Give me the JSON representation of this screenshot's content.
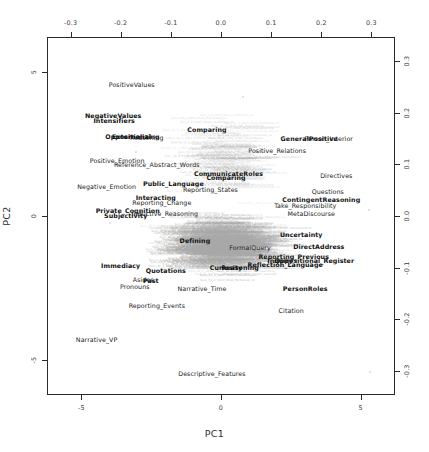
{
  "chart_data": {
    "type": "scatter",
    "title": "",
    "xlabel": "PC1",
    "ylabel": "PC2",
    "x_ticks_bottom": [
      "-5",
      "0",
      "5"
    ],
    "x_tick_values_bottom": [
      -5,
      0,
      5
    ],
    "x_ticks_top": [
      "-0.3",
      "-0.2",
      "-0.1",
      "0.0",
      "0.1",
      "0.2",
      "0.3"
    ],
    "x_tick_values_top": [
      -0.3,
      -0.2,
      -0.1,
      0.0,
      0.1,
      0.2,
      0.3
    ],
    "y_ticks_left": [
      "5",
      "0",
      "-5"
    ],
    "y_tick_values_left": [
      5,
      0,
      -5
    ],
    "y_ticks_right": [
      "0.3",
      "0.2",
      "0.1",
      "0.0",
      "-0.1",
      "-0.2",
      "-0.3"
    ],
    "y_tick_values_right": [
      0.3,
      0.2,
      0.1,
      0.0,
      -0.1,
      -0.2,
      -0.3
    ],
    "xlim": [
      -0.345,
      0.345
    ],
    "ylim": [
      -0.345,
      0.345
    ],
    "grid": false,
    "legend": "none",
    "variables": [
      {
        "label": "PositiveValues",
        "x": -0.178,
        "y": 0.256,
        "bold": false
      },
      {
        "label": "NegativeValues",
        "x": -0.215,
        "y": 0.196,
        "bold": true
      },
      {
        "label": "Intensifiers",
        "x": -0.213,
        "y": 0.186,
        "bold": true
      },
      {
        "label": "Oppositional",
        "x": -0.185,
        "y": 0.155,
        "bold": true
      },
      {
        "label": "Externalizing",
        "x": -0.17,
        "y": 0.155,
        "bold": true
      },
      {
        "label": "Reasoning",
        "x": -0.148,
        "y": 0.153,
        "bold": false
      },
      {
        "label": "Comparing",
        "x": -0.028,
        "y": 0.168,
        "bold": true
      },
      {
        "label": "GeneralPositive",
        "x": 0.176,
        "y": 0.152,
        "bold": true
      },
      {
        "label": "Person_Interior",
        "x": 0.215,
        "y": 0.152,
        "bold": false
      },
      {
        "label": "Positive_Relations",
        "x": 0.112,
        "y": 0.127,
        "bold": false
      },
      {
        "label": "Positive_Emotion",
        "x": -0.207,
        "y": 0.108,
        "bold": false
      },
      {
        "label": "Reference_Abstract_Words",
        "x": -0.128,
        "y": 0.1,
        "bold": false
      },
      {
        "label": "CommunicateRoles",
        "x": 0.015,
        "y": 0.084,
        "bold": true
      },
      {
        "label": "Comparing",
        "x": 0.01,
        "y": 0.076,
        "bold": true
      },
      {
        "label": "Directives",
        "x": 0.23,
        "y": 0.079,
        "bold": false
      },
      {
        "label": "Negative_Emotion",
        "x": -0.228,
        "y": 0.059,
        "bold": false
      },
      {
        "label": "Public_Language",
        "x": -0.095,
        "y": 0.063,
        "bold": true
      },
      {
        "label": "Reporting_States",
        "x": -0.021,
        "y": 0.053,
        "bold": false
      },
      {
        "label": "Questions",
        "x": 0.213,
        "y": 0.049,
        "bold": false
      },
      {
        "label": "Interacting",
        "x": -0.13,
        "y": 0.036,
        "bold": true
      },
      {
        "label": "Reporting_Change",
        "x": -0.118,
        "y": 0.027,
        "bold": false
      },
      {
        "label": "ContingentReasoning",
        "x": 0.2,
        "y": 0.033,
        "bold": true
      },
      {
        "label": "Take_Responsibility",
        "x": 0.168,
        "y": 0.022,
        "bold": false
      },
      {
        "label": "Private_Cognition",
        "x": -0.186,
        "y": 0.011,
        "bold": true
      },
      {
        "label": "Subjectivity",
        "x": -0.19,
        "y": 0.001,
        "bold": true
      },
      {
        "label": "Inductive_Reasoning",
        "x": -0.112,
        "y": 0.005,
        "bold": false
      },
      {
        "label": "MetaDiscourse",
        "x": 0.18,
        "y": 0.006,
        "bold": false
      },
      {
        "label": "Uncertainty",
        "x": 0.16,
        "y": -0.034,
        "bold": true
      },
      {
        "label": "Defining",
        "x": -0.052,
        "y": -0.046,
        "bold": true
      },
      {
        "label": "DirectAddress",
        "x": 0.195,
        "y": -0.058,
        "bold": true
      },
      {
        "label": "FormalQuery",
        "x": 0.058,
        "y": -0.06,
        "bold": false
      },
      {
        "label": "Reporting_Previous",
        "x": 0.145,
        "y": -0.077,
        "bold": true
      },
      {
        "label": "Inquiry",
        "x": 0.118,
        "y": -0.085,
        "bold": true
      },
      {
        "label": "Oppositional_Register",
        "x": 0.186,
        "y": -0.085,
        "bold": true
      },
      {
        "label": "Immediacy",
        "x": -0.2,
        "y": -0.095,
        "bold": true
      },
      {
        "label": "Reflection_Language",
        "x": 0.128,
        "y": -0.093,
        "bold": true
      },
      {
        "label": "Curiosity",
        "x": 0.01,
        "y": -0.098,
        "bold": true
      },
      {
        "label": "Reasoning",
        "x": 0.038,
        "y": -0.098,
        "bold": true
      },
      {
        "label": "Quotations",
        "x": -0.11,
        "y": -0.104,
        "bold": true
      },
      {
        "label": "Past",
        "x": -0.14,
        "y": -0.124,
        "bold": true
      },
      {
        "label": "Asides",
        "x": -0.155,
        "y": -0.122,
        "bold": false
      },
      {
        "label": "Pronouns",
        "x": -0.172,
        "y": -0.135,
        "bold": false
      },
      {
        "label": "Narrative_Time",
        "x": -0.038,
        "y": -0.14,
        "bold": false
      },
      {
        "label": "PersonRoles",
        "x": 0.168,
        "y": -0.14,
        "bold": true
      },
      {
        "label": "Reporting_Events",
        "x": -0.128,
        "y": -0.172,
        "bold": false
      },
      {
        "label": "Citation",
        "x": 0.14,
        "y": -0.182,
        "bold": false
      },
      {
        "label": "Narrative_VP",
        "x": -0.248,
        "y": -0.238,
        "bold": false
      },
      {
        "label": "Descriptive_Features",
        "x": -0.018,
        "y": -0.305,
        "bold": false
      }
    ],
    "stray_points": [
      {
        "x": -0.222,
        "y": -0.014
      },
      {
        "x": -0.17,
        "y": 0.125
      },
      {
        "x": 0.295,
        "y": 0.012
      },
      {
        "x": 0.297,
        "y": -0.302
      },
      {
        "x": 0.043,
        "y": 0.23
      }
    ],
    "observation_label_text": "Sum_38_5_1796_Order_SILandTyLus",
    "observation_samples": [
      "Sum_38_5_1796_Order_SILandTyLus",
      "Sum_34_2_1794_Mid_ShLandTy",
      "Sum_30_8_1790_Order_SILandTyLn",
      "Sum_38_5_1796_Order_SILandSkLan",
      "Sum_32_2_1792_Jason_TbLandLand",
      "Sum_30_3_1790_Mid_ShLandTyLus",
      "Sum_18_1_1916_Shed_Frameweb_es",
      "Sum_28_3_1798_Lawn_ThMaceLinLn",
      "Sum_31_4_1913_Shed_Partwoven_id",
      "Sum_12_3_1901_Morell_EarlLiesonErie",
      "Bare_23_3_1802_Shield_Lawrenceplor",
      "Colton_20_3_1901_Caldrick_Rowland-id",
      "Smalls_12_1_1887_Jonath_Lastcloth",
      "Sim_2_3_1903_Wood_Laidtimber_st",
      "Sum_26_1_1790_Shed_Darkwoven_es",
      "Sum_30_2_1793_Mace_Stemcloth-Lu",
      "Sum_18_4_1904_Brad_Frameweb_es",
      "Sum_21_2_1906_Oak_Armoulith-id",
      "Sum_15_2_1899_Hearth_Lacebound-le"
    ],
    "observation_count_note": ""
  }
}
